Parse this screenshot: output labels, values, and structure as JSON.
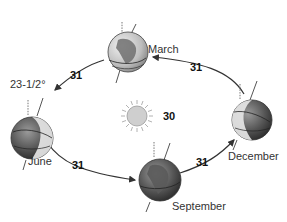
{
  "diagram": {
    "sun": {
      "label": "30",
      "icon": "sun-icon"
    },
    "axial_tilt_label": "23-1/2°",
    "positions": [
      {
        "id": "march",
        "label": "March"
      },
      {
        "id": "june",
        "label": "June"
      },
      {
        "id": "september",
        "label": "September"
      },
      {
        "id": "december",
        "label": "December"
      }
    ],
    "arc_labels": [
      {
        "from": "march",
        "to": "june",
        "value": "31"
      },
      {
        "from": "december",
        "to": "march",
        "value": "31"
      },
      {
        "from": "june",
        "to": "september",
        "value": "31"
      },
      {
        "from": "september",
        "to": "december",
        "value": "31"
      }
    ],
    "colors": {
      "globe_dark": "#3a3a3a",
      "globe_mid": "#7a7a7a",
      "globe_light": "#d8d8d8",
      "sun_fill": "#d0d0d0",
      "sun_stroke": "#9a9a9a",
      "arrow": "#333333"
    }
  }
}
